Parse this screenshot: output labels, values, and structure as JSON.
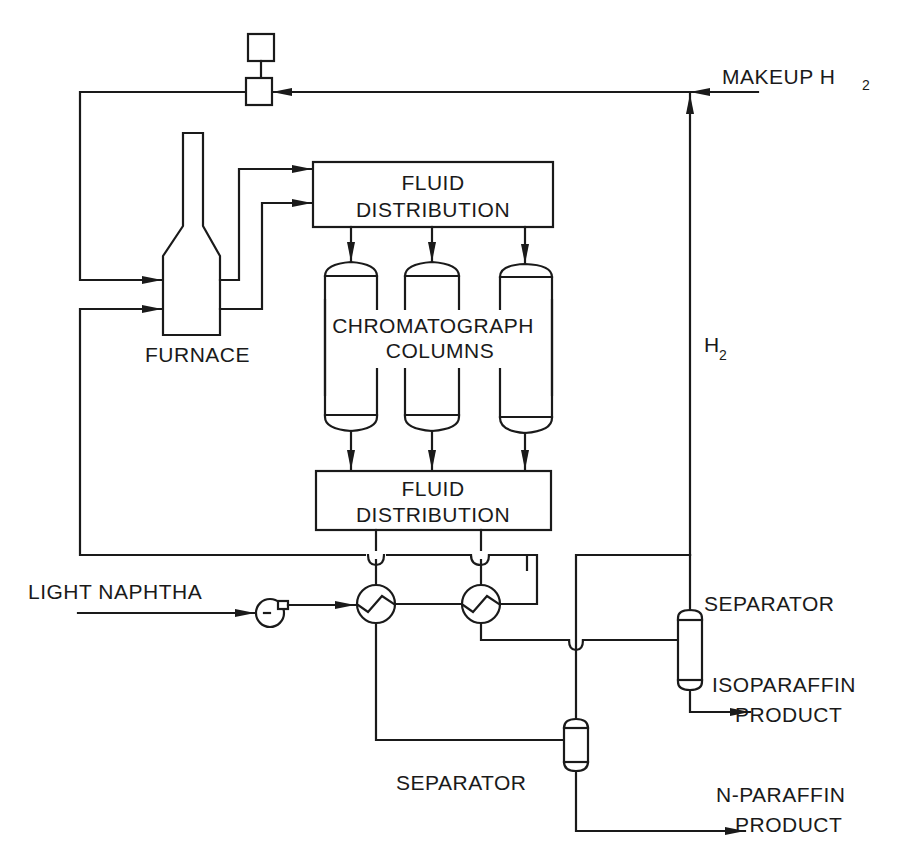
{
  "diagram": {
    "type": "process-flow",
    "colors": {
      "line": "#1a1a1a",
      "background": "#ffffff"
    },
    "labels": {
      "makeup_h2": "MAKEUP H",
      "makeup_h2_sub": "2",
      "h2": "H",
      "h2_sub": "2",
      "furnace": "FURNACE",
      "fluid_dist_top_1": "FLUID",
      "fluid_dist_top_2": "DISTRIBUTION",
      "chromatograph_1": "CHROMATOGRAPH",
      "chromatograph_2": "COLUMNS",
      "fluid_dist_bottom_1": "FLUID",
      "fluid_dist_bottom_2": "DISTRIBUTION",
      "light_naphtha": "LIGHT NAPHTHA",
      "separator_upper": "SEPARATOR",
      "separator_lower": "SEPARATOR",
      "isoparaffin_1": "ISOPARAFFIN",
      "isoparaffin_2": "PRODUCT",
      "nparaffin_1": "N-PARAFFIN",
      "nparaffin_2": "PRODUCT"
    },
    "nodes": [
      {
        "id": "compressor",
        "name": "Compressor / control unit"
      },
      {
        "id": "furnace",
        "name": "Furnace"
      },
      {
        "id": "fluid-distribution-top",
        "name": "Fluid Distribution (inlet)"
      },
      {
        "id": "chromatograph-columns",
        "name": "Chromatograph Columns",
        "count": 3
      },
      {
        "id": "fluid-distribution-bottom",
        "name": "Fluid Distribution (outlet)"
      },
      {
        "id": "pump",
        "name": "Feed pump"
      },
      {
        "id": "heat-exchanger-1",
        "name": "Heat exchanger 1"
      },
      {
        "id": "heat-exchanger-2",
        "name": "Heat exchanger 2"
      },
      {
        "id": "separator-upper",
        "name": "Separator (isoparaffin)"
      },
      {
        "id": "separator-lower",
        "name": "Separator (n-paraffin)"
      }
    ]
  }
}
